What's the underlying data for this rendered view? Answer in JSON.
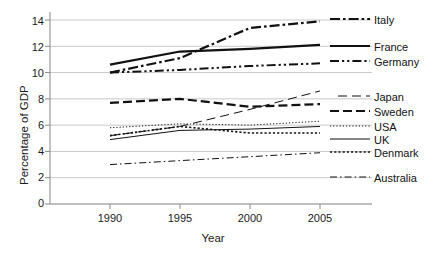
{
  "chart_data": {
    "type": "line",
    "title": "",
    "xlabel": "Year",
    "ylabel": "Percentage of GDP",
    "x": [
      1990,
      1995,
      2000,
      2005
    ],
    "xlim": [
      1988.5,
      2006.5
    ],
    "ylim": [
      0,
      14.6
    ],
    "xticks": [
      1990,
      1995,
      2000,
      2005
    ],
    "yticks": [
      0,
      2,
      4,
      6,
      8,
      10,
      12,
      14
    ],
    "grid": "horizontal",
    "legend_position": "right-inline-labels",
    "series": [
      {
        "name": "Italy",
        "values": [
          10.0,
          11.1,
          13.4,
          13.9
        ],
        "style": "dash-dot",
        "color": "#111111",
        "width": 2.2
      },
      {
        "name": "France",
        "values": [
          10.6,
          11.6,
          11.8,
          12.1
        ],
        "style": "solid",
        "color": "#111111",
        "width": 2.2
      },
      {
        "name": "Germany",
        "values": [
          10.0,
          10.2,
          10.5,
          10.7
        ],
        "style": "dash-dot-dot",
        "color": "#111111",
        "width": 2.0
      },
      {
        "name": "Japan",
        "values": [
          5.2,
          5.9,
          7.2,
          8.6
        ],
        "style": "long-dash-thin",
        "color": "#111111",
        "width": 1.0
      },
      {
        "name": "Sweden",
        "values": [
          7.7,
          8.0,
          7.4,
          7.6
        ],
        "style": "dashed",
        "color": "#111111",
        "width": 2.2
      },
      {
        "name": "USA",
        "values": [
          5.8,
          6.1,
          6.0,
          6.3
        ],
        "style": "dotted-fine",
        "color": "#111111",
        "width": 1.0
      },
      {
        "name": "UK",
        "values": [
          4.9,
          5.6,
          5.7,
          5.9
        ],
        "style": "solid-thin",
        "color": "#111111",
        "width": 1.0
      },
      {
        "name": "Denmark",
        "values": [
          5.2,
          5.9,
          5.4,
          5.4
        ],
        "style": "dotted-square",
        "color": "#111111",
        "width": 1.6
      },
      {
        "name": "Australia",
        "values": [
          3.0,
          3.3,
          3.6,
          3.9
        ],
        "style": "dash-dot-thin",
        "color": "#111111",
        "width": 1.0
      }
    ]
  },
  "axes": {
    "y_tick_labels": [
      "14",
      "12",
      "10",
      "8",
      "6",
      "4",
      "2",
      "0"
    ],
    "x_tick_labels": [
      "1990",
      "1995",
      "2000",
      "2005"
    ],
    "y_title": "Percentage of GDP",
    "x_title": "Year"
  },
  "labels": {
    "italy": "Italy",
    "france": "France",
    "germany": "Germany",
    "japan": "Japan",
    "sweden": "Sweden",
    "usa": "USA",
    "uk": "UK",
    "denmark": "Denmark",
    "australia": "Australia"
  },
  "colors": {
    "line": "#111111",
    "grid": "#c9c9c9",
    "axis": "#8a8a8a",
    "text": "#1a1a1a",
    "background": "#ffffff"
  }
}
